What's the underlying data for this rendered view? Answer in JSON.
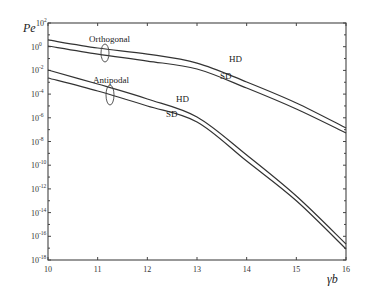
{
  "chart_data": {
    "type": "line",
    "title": "",
    "xlabel": "γb",
    "ylabel": "Pe",
    "xlim": [
      10,
      16
    ],
    "ylim_log10": [
      -18,
      2
    ],
    "yscale": "log",
    "grid": false,
    "x_ticks": [
      10,
      11,
      12,
      13,
      14,
      15,
      16
    ],
    "y_ticks_log10": [
      2,
      0,
      -2,
      -4,
      -6,
      -8,
      -10,
      -12,
      -14,
      -16,
      -18
    ],
    "x": [
      10,
      11,
      12,
      13,
      14,
      15,
      16
    ],
    "series": [
      {
        "name": "Orthogonal HD",
        "group": "Orthogonal",
        "decoding": "HD",
        "log10_values": [
          0.57,
          -0.11,
          -0.62,
          -1.38,
          -2.98,
          -4.75,
          -6.86
        ]
      },
      {
        "name": "Orthogonal SD",
        "group": "Orthogonal",
        "decoding": "SD",
        "log10_values": [
          0.06,
          -0.62,
          -1.21,
          -1.88,
          -3.49,
          -5.26,
          -7.28
        ]
      },
      {
        "name": "Antipodal HD",
        "group": "Antipodal",
        "decoding": "HD",
        "log10_values": [
          -1.97,
          -3.15,
          -4.41,
          -5.93,
          -9.14,
          -12.6,
          -16.65
        ]
      },
      {
        "name": "Antipodal SD",
        "group": "Antipodal",
        "decoding": "SD",
        "log10_values": [
          -2.64,
          -3.74,
          -5.0,
          -6.35,
          -9.65,
          -13.0,
          -17.07
        ]
      }
    ],
    "annotations": [
      {
        "text": "Orthogonal",
        "x": 11.1,
        "log10_y": 1.7
      },
      {
        "text": "Antipodal",
        "x": 11.15,
        "log10_y": -1.7
      },
      {
        "text": "HD",
        "x": 12.7,
        "log10_y": -1.0
      },
      {
        "text": "SD",
        "x": 12.55,
        "log10_y": -2.5
      },
      {
        "text": "HD",
        "x": 11.8,
        "log10_y": -4.6
      },
      {
        "text": "SD",
        "x": 11.6,
        "log10_y": -5.9
      }
    ]
  },
  "labels": {
    "ylabel": "Pe",
    "xlabel": "γb",
    "orthogonal": "Orthogonal",
    "antipodal": "Antipodal",
    "hd": "HD",
    "sd": "SD"
  }
}
